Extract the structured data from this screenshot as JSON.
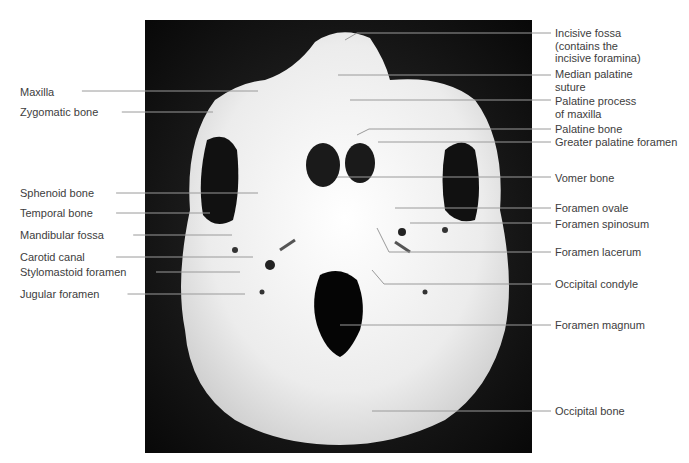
{
  "figure": {
    "colors": {
      "background": "#ffffff",
      "photo_bg": "#101010",
      "bone": "#ececec",
      "leader": "#9a9a9a",
      "text": "#3d3d3d"
    }
  },
  "labels_left": [
    {
      "text": "Maxilla",
      "y": 86,
      "lx2": 258,
      "ly2": 91
    },
    {
      "text": "Zygomatic bone",
      "y": 106,
      "lx2": 213,
      "ly2": 112
    },
    {
      "text": "Sphenoid bone",
      "y": 187,
      "lx2": 258,
      "ly2": 193
    },
    {
      "text": "Temporal bone",
      "y": 207,
      "lx2": 210,
      "ly2": 213
    },
    {
      "text": "Mandibular fossa",
      "y": 229,
      "lx2": 232,
      "ly2": 235
    },
    {
      "text": "Carotid canal",
      "y": 251,
      "lx2": 253,
      "ly2": 257
    },
    {
      "text": "Stylomastoid foramen",
      "y": 266,
      "lx2": 240,
      "ly2": 272
    },
    {
      "text": "Jugular foramen",
      "y": 288,
      "lx2": 245,
      "ly2": 294
    }
  ],
  "labels_right": [
    {
      "text": "Incisive fossa\n(contains the\nincisive foramina)",
      "y": 27,
      "lx1": 345,
      "ly1": 40,
      "ly2": 33
    },
    {
      "text": "Median palatine\nsuture",
      "y": 68,
      "lx1": 338,
      "ly1": 75,
      "ly2": 75
    },
    {
      "text": "Palatine process\nof maxilla",
      "y": 95,
      "lx1": 350,
      "ly1": 100,
      "ly2": 100
    },
    {
      "text": "Palatine bone",
      "y": 123,
      "lx1": 357,
      "ly1": 135,
      "ly2": 129
    },
    {
      "text": "Greater palatine foramen",
      "y": 136,
      "lx1": 378,
      "ly1": 142,
      "ly2": 142
    },
    {
      "text": "Vomer bone",
      "y": 172,
      "lx1": 337,
      "ly1": 177,
      "ly2": 177
    },
    {
      "text": "Foramen ovale",
      "y": 202,
      "lx1": 395,
      "ly1": 208,
      "ly2": 208
    },
    {
      "text": "Foramen spinosum",
      "y": 218,
      "lx1": 410,
      "ly1": 223,
      "ly2": 223
    },
    {
      "text": "Foramen lacerum",
      "y": 246,
      "lx1": 377,
      "ly1": 228,
      "ly2": 252
    },
    {
      "text": "Occipital condyle",
      "y": 278,
      "lx1": 372,
      "ly1": 270,
      "ly2": 284
    },
    {
      "text": "Foramen magnum",
      "y": 319,
      "lx1": 340,
      "ly1": 325,
      "ly2": 325
    },
    {
      "text": "Occipital bone",
      "y": 405,
      "lx1": 372,
      "ly1": 411,
      "ly2": 411
    }
  ]
}
